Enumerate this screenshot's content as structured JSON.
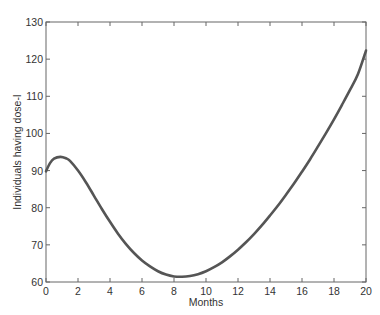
{
  "chart_data": {
    "type": "line",
    "title": "",
    "xlabel": "Months",
    "ylabel": "Individuals having dose-I",
    "xlim": [
      0,
      20
    ],
    "ylim": [
      60,
      130
    ],
    "xticks": [
      0,
      2,
      4,
      6,
      8,
      10,
      12,
      14,
      16,
      18,
      20
    ],
    "yticks": [
      60,
      70,
      80,
      90,
      100,
      110,
      120,
      130
    ],
    "grid": false,
    "legend": null,
    "series": [
      {
        "name": "Individuals having dose-I",
        "color": "#555555",
        "x": [
          0,
          0.25,
          0.5,
          0.9,
          1.25,
          1.5,
          2,
          2.5,
          3,
          3.5,
          4,
          4.5,
          5,
          5.5,
          6,
          6.5,
          7,
          7.5,
          8,
          8.5,
          9,
          9.5,
          10,
          10.5,
          11,
          11.5,
          12,
          12.5,
          13,
          13.5,
          14,
          14.5,
          15,
          15.5,
          16,
          16.5,
          17,
          17.5,
          18,
          18.5,
          19,
          19.5,
          20
        ],
        "values": [
          89.8,
          92.0,
          93.2,
          93.7,
          93.3,
          92.6,
          90.0,
          86.8,
          83.2,
          79.6,
          76.2,
          73.0,
          70.2,
          67.8,
          65.8,
          64.2,
          62.9,
          62.0,
          61.5,
          61.4,
          61.6,
          62.1,
          62.9,
          64.0,
          65.3,
          66.9,
          68.7,
          70.7,
          72.9,
          75.3,
          77.9,
          80.6,
          83.5,
          86.5,
          89.7,
          93.0,
          96.5,
          100.1,
          103.8,
          107.7,
          111.7,
          116.0,
          122.3
        ]
      }
    ]
  }
}
